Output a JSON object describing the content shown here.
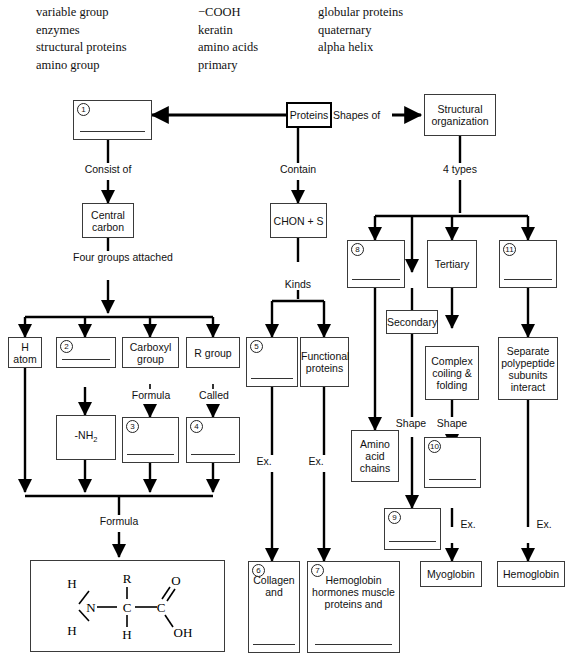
{
  "word_bank": {
    "columns": [
      [
        "variable group",
        "enzymes",
        "structural proteins",
        "amino group"
      ],
      [
        "−COOH",
        "keratin",
        "amino acids",
        "primary"
      ],
      [
        "globular proteins",
        "quaternary",
        "alpha helix"
      ]
    ]
  },
  "diagram": {
    "nodes": {
      "proteins": "Proteins",
      "blank1": "",
      "central_carbon": "Central carbon",
      "structural_org": "Structural organization",
      "chon": "CHON + S",
      "h_atom": "H atom",
      "blank2": "",
      "carboxyl_group": "Carboxyl group",
      "r_group": "R group",
      "nh2": "-NH2",
      "blank3": "",
      "blank4": "",
      "blank5": "",
      "functional_proteins": "Functional proteins",
      "blank8": "",
      "tertiary": "Tertiary",
      "blank11": "",
      "secondary": "Secondary",
      "complex_coiling": "Complex coiling & folding",
      "separate_subunits": "Separate polypeptide subunits interact",
      "amino_acid_chains": "Amino acid chains",
      "blank10": "",
      "blank9": "",
      "myoglobin": "Myoglobin",
      "hemoglobin": "Hemoglobin",
      "blank6": "Collagen and",
      "blank7": "Hemoglobin hormones muscle proteins and"
    },
    "numbers": {
      "n1": "1",
      "n2": "2",
      "n3": "3",
      "n4": "4",
      "n5": "5",
      "n6": "6",
      "n7": "7",
      "n8": "8",
      "n9": "9",
      "n10": "10",
      "n11": "11"
    },
    "edge_labels": {
      "consist_of": "Consist of",
      "contain": "Contain",
      "shapes_of": "Shapes of",
      "four_types": "4 types",
      "four_groups_attached": "Four groups attached",
      "kinds": "Kinds",
      "formula_carboxyl": "Formula",
      "called": "Called",
      "formula_bottom": "Formula",
      "ex1": "Ex.",
      "ex2": "Ex.",
      "ex3": "Ex.",
      "ex4": "Ex.",
      "shape_left": "Shape",
      "shape_right": "Shape"
    },
    "formula": {
      "atoms": {
        "h_top_left": "H",
        "r_top": "R",
        "o_top_right": "O",
        "n": "N",
        "c_center": "C",
        "c_right": "C",
        "h_bottom_left": "H",
        "h_bottom_center": "H",
        "oh": "OH"
      }
    }
  }
}
